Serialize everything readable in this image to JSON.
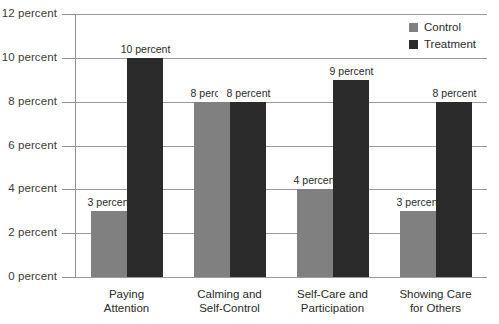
{
  "chart_data": {
    "type": "bar",
    "title": "",
    "xlabel": "",
    "ylabel": "",
    "ylim": [
      0,
      12
    ],
    "ytick_values": [
      0,
      2,
      4,
      6,
      8,
      10,
      12
    ],
    "ytick_labels": [
      "0 percent",
      "2 percent",
      "4 percent",
      "6 percent",
      "8 percent",
      "10 percent",
      "12 percent"
    ],
    "grid": true,
    "legend_position": "top-right",
    "categories": [
      {
        "line1": "Paying",
        "line2": "Attention"
      },
      {
        "line1": "Calming and",
        "line2": "Self-Control"
      },
      {
        "line1": "Self-Care and",
        "line2": "Participation"
      },
      {
        "line1": "Showing Care",
        "line2": "for Others"
      }
    ],
    "series": [
      {
        "name": "Control",
        "color": "#808080",
        "values": [
          3,
          8,
          4,
          3
        ],
        "value_labels": [
          "3 percent",
          "8 percent",
          "4 percent",
          "3 percent"
        ]
      },
      {
        "name": "Treatment",
        "color": "#2b2b2b",
        "values": [
          10,
          8,
          9,
          8
        ],
        "value_labels": [
          "10 percent",
          "8 percent",
          "9 percent",
          "8 percent"
        ]
      }
    ]
  },
  "legend": {
    "items": [
      {
        "label": "Control",
        "swatch": "control-swatch-icon"
      },
      {
        "label": "Treatment",
        "swatch": "treatment-swatch-icon"
      }
    ]
  },
  "colors": {
    "control": "#808080",
    "treatment": "#2b2b2b",
    "gridline": "#9a9a9a",
    "axis": "#8e8e8e",
    "background": "#ffffff",
    "text": "#2a2a2a"
  }
}
